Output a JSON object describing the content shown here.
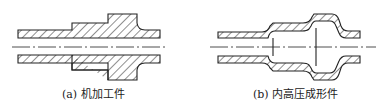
{
  "figures": [
    {
      "id": "a",
      "caption": "(a) 机加工件",
      "subject": "machined part"
    },
    {
      "id": "b",
      "caption": "(b) 内高压成形件",
      "subject": "hydroformed part"
    }
  ],
  "colors": {
    "line": "#222222",
    "background": "#ffffff"
  }
}
